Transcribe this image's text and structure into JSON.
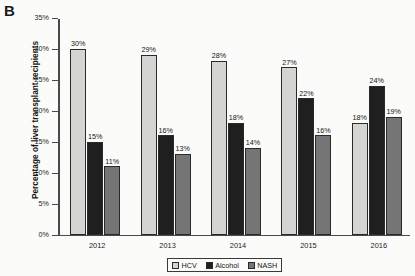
{
  "panel": {
    "label": "B"
  },
  "chart_data": {
    "type": "bar",
    "title": "",
    "xlabel": "",
    "ylabel": "Percentage of liver transplant recipients",
    "ylim": [
      0,
      35
    ],
    "grid": false,
    "legend_position": "bottom-center",
    "categories": [
      "2012",
      "2013",
      "2014",
      "2015",
      "2016"
    ],
    "ytick_labels": [
      "0%",
      "5%",
      "10%",
      "15%",
      "20%",
      "25%",
      "30%",
      "35%"
    ],
    "ytick_values": [
      0,
      5,
      10,
      15,
      20,
      25,
      30,
      35
    ],
    "series": [
      {
        "name": "HCV",
        "color": "#d4d4d2",
        "values": [
          30,
          29,
          28,
          27,
          18
        ],
        "labels": [
          "30%",
          "29%",
          "28%",
          "27%",
          "18%"
        ]
      },
      {
        "name": "Alcohol",
        "color": "#1f1f1f",
        "values": [
          15,
          16,
          18,
          22,
          24
        ],
        "labels": [
          "15%",
          "16%",
          "18%",
          "22%",
          "24%"
        ]
      },
      {
        "name": "NASH",
        "color": "#757575",
        "values": [
          11,
          13,
          14,
          16,
          19
        ],
        "labels": [
          "11%",
          "13%",
          "14%",
          "16%",
          "19%"
        ]
      }
    ]
  }
}
